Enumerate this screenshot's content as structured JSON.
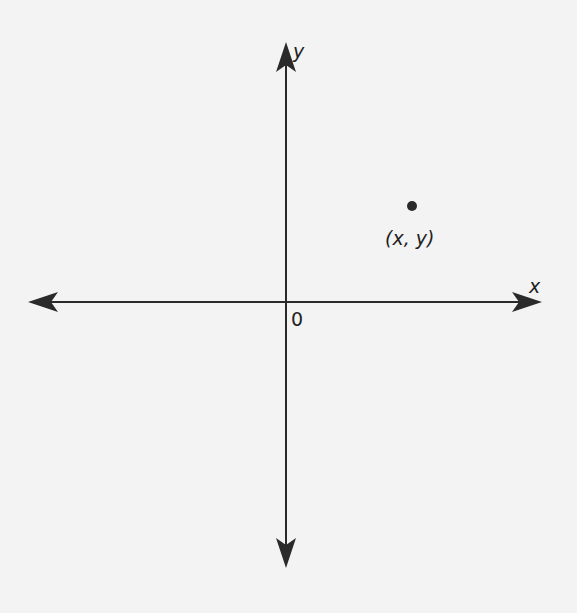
{
  "diagram": {
    "type": "cartesian-plane",
    "background": "#f3f3f3",
    "ink": "#2a2a2a",
    "x_axis": {
      "label": "x",
      "arrow_both_ends": true
    },
    "y_axis": {
      "label": "y",
      "arrow_both_ends": true
    },
    "origin": {
      "label": "0"
    },
    "point": {
      "label": "(x, y)",
      "quadrant": "I"
    }
  }
}
